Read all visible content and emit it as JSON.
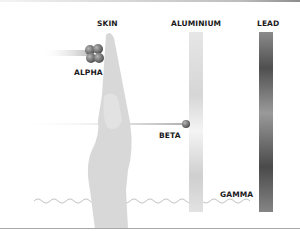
{
  "diagram": {
    "barriers": [
      {
        "label": "SKIN"
      },
      {
        "label": "ALUMINIUM"
      },
      {
        "label": "LEAD"
      }
    ],
    "radiation": [
      {
        "label": "ALPHA",
        "stopped_by": "SKIN"
      },
      {
        "label": "BETA",
        "stopped_by": "ALUMINIUM"
      },
      {
        "label": "GAMMA",
        "stopped_by": "LEAD"
      }
    ],
    "colors": {
      "hand": "#d9d9d9",
      "aluminium": "#e4e4e4",
      "lead": "#6e6e6e",
      "particle": "#6a6a6a",
      "label": "#1a1a1a",
      "wave": "#bdbdbd"
    }
  }
}
